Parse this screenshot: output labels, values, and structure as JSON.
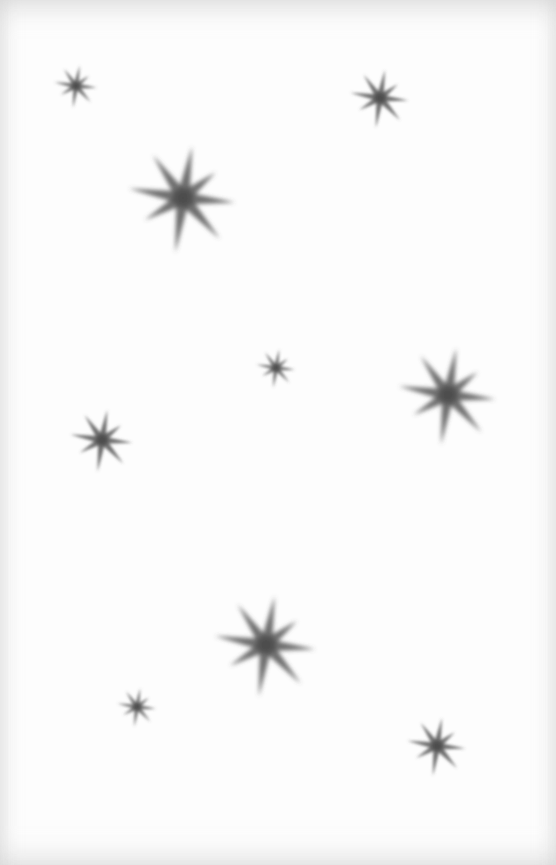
{
  "image": {
    "description": "Eight-pointed soft gray stars scattered on a white page",
    "background_color": "#fdfdfd",
    "star_color": "#555555",
    "star_count": 10
  },
  "stars": [
    {
      "name": "star-top-left-small",
      "size": "small"
    },
    {
      "name": "star-top-right-small",
      "size": "small"
    },
    {
      "name": "star-upper-left-large",
      "size": "large"
    },
    {
      "name": "star-center-small",
      "size": "tiny"
    },
    {
      "name": "star-right-large",
      "size": "large"
    },
    {
      "name": "star-left-medium",
      "size": "small"
    },
    {
      "name": "star-lower-center-large",
      "size": "large"
    },
    {
      "name": "star-lower-left-small",
      "size": "tiny"
    },
    {
      "name": "star-bottom-right-small",
      "size": "small"
    }
  ]
}
